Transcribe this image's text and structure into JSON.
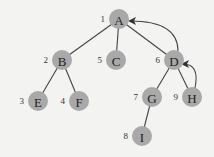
{
  "diagram": {
    "type": "tree-dfs-traversal",
    "node_fill": "#a9a9a9",
    "edge_color": "#444444",
    "background": "#f3f3f1",
    "nodes": [
      {
        "id": "A",
        "label": "A",
        "order": "1",
        "x": 119,
        "y": 19
      },
      {
        "id": "B",
        "label": "B",
        "order": "2",
        "x": 62,
        "y": 60
      },
      {
        "id": "C",
        "label": "C",
        "order": "5",
        "x": 116,
        "y": 60
      },
      {
        "id": "D",
        "label": "D",
        "order": "6",
        "x": 174,
        "y": 60
      },
      {
        "id": "E",
        "label": "E",
        "order": "3",
        "x": 38,
        "y": 101
      },
      {
        "id": "F",
        "label": "F",
        "order": "4",
        "x": 79,
        "y": 101
      },
      {
        "id": "G",
        "label": "G",
        "order": "7",
        "x": 152,
        "y": 97
      },
      {
        "id": "H",
        "label": "H",
        "order": "9",
        "x": 192,
        "y": 97
      },
      {
        "id": "I",
        "label": "I",
        "order": "8",
        "x": 142,
        "y": 136
      }
    ],
    "edges": [
      {
        "from": "A",
        "to": "B"
      },
      {
        "from": "A",
        "to": "C"
      },
      {
        "from": "A",
        "to": "D"
      },
      {
        "from": "B",
        "to": "E"
      },
      {
        "from": "B",
        "to": "F"
      },
      {
        "from": "D",
        "to": "G"
      },
      {
        "from": "D",
        "to": "H"
      },
      {
        "from": "G",
        "to": "I"
      }
    ],
    "back_arrows": [
      {
        "from": "D",
        "to": "A"
      },
      {
        "from": "H",
        "to": "D"
      }
    ]
  }
}
